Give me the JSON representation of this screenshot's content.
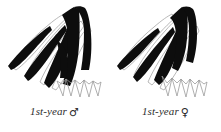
{
  "figure": {
    "type": "ornithological-wing-molt-diagram",
    "background_color": "#ffffff",
    "ink_color": "#0d0d0d",
    "outline_color": "#8c8c8c",
    "panel_count": 2
  },
  "panels": [
    {
      "id": "male",
      "caption_text": "1st-year",
      "sex_symbol": "♂",
      "sex_name": "male",
      "age_class": "1st-year",
      "description": "Wing diagram with extensive black (replaced) primaries and primary coverts, pale retained outer feathers, thin grey secondary outlines forming a zigzag trailing edge"
    },
    {
      "id": "female",
      "caption_text": "1st-year",
      "sex_symbol": "♀",
      "sex_name": "female",
      "age_class": "1st-year",
      "description": "Wing diagram with less extensive black feather tracts than the male, pale retained feathers, thin grey secondary outlines forming a zigzag trailing edge"
    }
  ]
}
